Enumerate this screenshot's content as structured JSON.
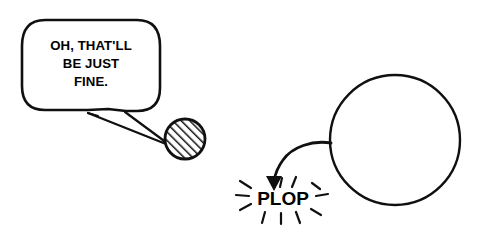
{
  "canvas": {
    "width": 486,
    "height": 241,
    "background_color": "#ffffff",
    "ink_color": "#101010"
  },
  "speech_bubble": {
    "name": "speech-bubble",
    "shape": "rounded-rectangle",
    "lines": [
      "OH, THAT'LL",
      "BE JUST",
      "FINE."
    ],
    "full_text": "OH, THAT'LL BE JUST FINE.",
    "tail_direction": "down-right",
    "bounds": {
      "x": 22,
      "y": 20,
      "width": 138,
      "height": 92
    }
  },
  "hatched_circle": {
    "name": "hatched-circle",
    "fill_pattern": "diagonal-hatch",
    "hatch_angle_degrees": 45,
    "center": {
      "x": 185,
      "y": 139
    },
    "radius": 22
  },
  "large_circle": {
    "name": "large-circle",
    "fill": "none",
    "center": {
      "x": 395,
      "y": 140
    },
    "radius": 65
  },
  "curved_arrow": {
    "name": "curved-arrow",
    "from": "large-circle-left-edge",
    "to": "plop-label",
    "head": "filled-triangle",
    "head_direction": "down"
  },
  "plop": {
    "name": "plop-label",
    "text": "PLOP",
    "impact_lines": 11,
    "center": {
      "x": 283,
      "y": 198
    }
  }
}
